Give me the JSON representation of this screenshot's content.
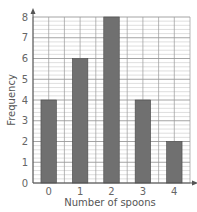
{
  "chart_data": {
    "type": "bar",
    "title": "",
    "categories": [
      "0",
      "1",
      "2",
      "3",
      "4"
    ],
    "values": [
      4,
      6,
      8,
      4,
      2
    ],
    "xlabel": "Number of spoons",
    "ylabel": "Frequency",
    "ylim": [
      0,
      8
    ],
    "yticks": [
      0,
      1,
      2,
      3,
      4,
      5,
      6,
      7,
      8
    ],
    "minor_divisions_per_unit": 5,
    "grid": true,
    "legend": null
  },
  "colors": {
    "bar": "#707070",
    "bar_edge": "#4a4a4a",
    "major_grid": "#9a9a9a",
    "minor_grid": "#c8c8c8",
    "axis": "#555555"
  }
}
